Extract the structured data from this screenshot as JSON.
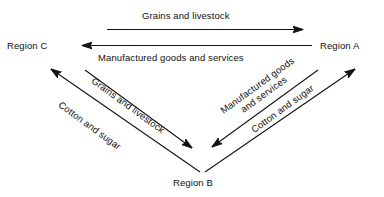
{
  "diagram": {
    "background_color": "#ffffff",
    "line_color": "#111111",
    "nodes": [
      {
        "id": "region-c",
        "label": "Region C",
        "x": 37,
        "y": 46
      },
      {
        "id": "region-a",
        "label": "Region A",
        "x": 349,
        "y": 46
      },
      {
        "id": "region-b",
        "label": "Region B",
        "x": 202,
        "y": 183
      }
    ],
    "edges": [
      {
        "id": "c-to-a-grains",
        "label": "Grains and livestock",
        "from": "region-c",
        "to": "region-a",
        "direction": "right",
        "label_x": 204,
        "label_y": 16,
        "rotation": 0
      },
      {
        "id": "a-to-c-manufactured",
        "label": "Manufactured goods and services",
        "from": "region-a",
        "to": "region-c",
        "direction": "left",
        "label_x": 195,
        "label_y": 58,
        "rotation": 0
      },
      {
        "id": "c-to-b-grains",
        "label": "Grains and livestock",
        "from": "region-c",
        "to": "region-b",
        "direction": "down-right",
        "label_x": 96,
        "label_y": 80,
        "rotation": 36
      },
      {
        "id": "b-to-c-cotton",
        "label": "Cotton and sugar",
        "from": "region-b",
        "to": "region-c",
        "direction": "up-left",
        "label_x": 66,
        "label_y": 104,
        "rotation": 36
      },
      {
        "id": "a-to-b-manufactured",
        "label": "Manufactured goods and services",
        "label_line1": "Manufactured goods",
        "label_line2": "and services",
        "from": "region-a",
        "to": "region-b",
        "direction": "down-left",
        "label_x": 234,
        "label_y": 88,
        "rotation": -36
      },
      {
        "id": "b-to-a-cotton",
        "label": "Cotton and sugar",
        "from": "region-b",
        "to": "region-a",
        "direction": "up-right",
        "label_x": 253,
        "label_y": 124,
        "rotation": -36
      }
    ]
  }
}
